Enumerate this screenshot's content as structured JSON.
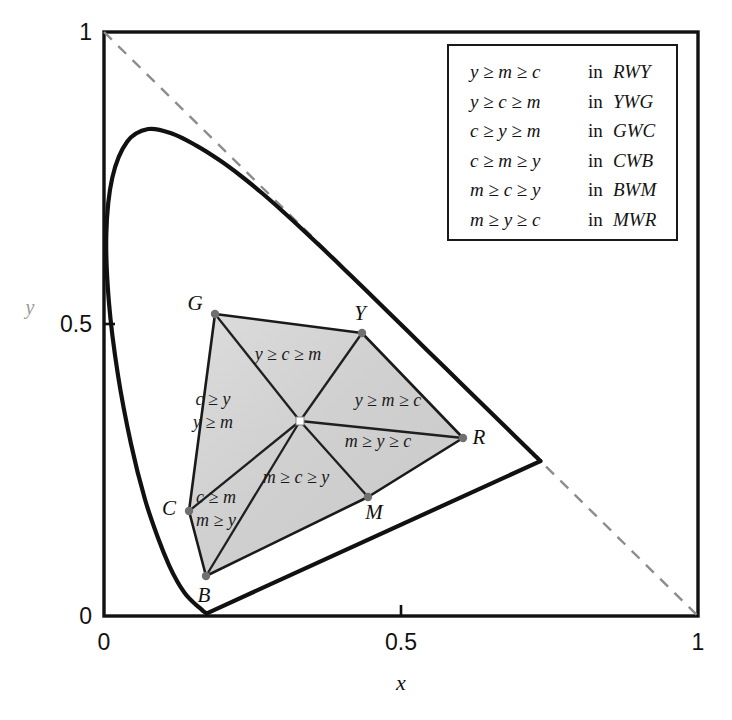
{
  "chart_data": {
    "type": "scatter",
    "title": "",
    "xlabel": "x",
    "ylabel": "y",
    "xlim": [
      0,
      1
    ],
    "ylim": [
      0,
      1
    ],
    "grid": false,
    "legend_position": "top-right",
    "xticks": [
      "0",
      "0.5",
      "1"
    ],
    "xtick_values": [
      0,
      0.5,
      1
    ],
    "yticks": [
      "0",
      "0.5",
      "1"
    ],
    "ytick_values": [
      0,
      0.5,
      1
    ],
    "annotations": [
      "CIE xy chromaticity diagram with spectral locus, purple line and RGB gamut hexagon"
    ],
    "series": [
      {
        "name": "spectral locus",
        "style": "solid-thick",
        "points": [
          [
            0.1741,
            0.005
          ],
          [
            0.174,
            0.005
          ],
          [
            0.1738,
            0.0049
          ],
          [
            0.1736,
            0.0049
          ],
          [
            0.1733,
            0.0048
          ],
          [
            0.173,
            0.0048
          ],
          [
            0.1726,
            0.0048
          ],
          [
            0.1721,
            0.0048
          ],
          [
            0.1714,
            0.0051
          ],
          [
            0.1703,
            0.0058
          ],
          [
            0.1689,
            0.0069
          ],
          [
            0.1669,
            0.0086
          ],
          [
            0.1644,
            0.0109
          ],
          [
            0.1611,
            0.0138
          ],
          [
            0.1566,
            0.0177
          ],
          [
            0.151,
            0.0227
          ],
          [
            0.144,
            0.0297
          ],
          [
            0.1355,
            0.0399
          ],
          [
            0.1241,
            0.0578
          ],
          [
            0.1096,
            0.0868
          ],
          [
            0.0913,
            0.1327
          ],
          [
            0.0687,
            0.2007
          ],
          [
            0.0454,
            0.295
          ],
          [
            0.0235,
            0.4127
          ],
          [
            0.0082,
            0.5384
          ],
          [
            0.0039,
            0.6548
          ],
          [
            0.0139,
            0.7502
          ],
          [
            0.0389,
            0.812
          ],
          [
            0.0743,
            0.8338
          ],
          [
            0.1142,
            0.8262
          ],
          [
            0.1547,
            0.8059
          ],
          [
            0.1929,
            0.7816
          ],
          [
            0.2296,
            0.7543
          ],
          [
            0.2658,
            0.7243
          ],
          [
            0.3016,
            0.6923
          ],
          [
            0.3373,
            0.6589
          ],
          [
            0.3731,
            0.6245
          ],
          [
            0.4087,
            0.5896
          ],
          [
            0.4441,
            0.5547
          ],
          [
            0.4788,
            0.5202
          ],
          [
            0.5125,
            0.4866
          ],
          [
            0.5448,
            0.4544
          ],
          [
            0.5752,
            0.4242
          ],
          [
            0.6029,
            0.3965
          ],
          [
            0.627,
            0.3725
          ],
          [
            0.6482,
            0.3514
          ],
          [
            0.6658,
            0.334
          ],
          [
            0.6801,
            0.3197
          ],
          [
            0.6915,
            0.3083
          ],
          [
            0.7006,
            0.2993
          ],
          [
            0.7079,
            0.292
          ],
          [
            0.714,
            0.2859
          ],
          [
            0.719,
            0.2809
          ],
          [
            0.723,
            0.277
          ],
          [
            0.726,
            0.274
          ],
          [
            0.7283,
            0.2717
          ],
          [
            0.73,
            0.27
          ],
          [
            0.7311,
            0.2689
          ],
          [
            0.732,
            0.268
          ],
          [
            0.7327,
            0.2673
          ],
          [
            0.7334,
            0.2666
          ],
          [
            0.734,
            0.266
          ],
          [
            0.7344,
            0.2656
          ],
          [
            0.7346,
            0.2654
          ],
          [
            0.7347,
            0.2653
          ]
        ]
      },
      {
        "name": "purple line",
        "style": "solid-thick",
        "points": [
          [
            0.7347,
            0.2653
          ],
          [
            0.1741,
            0.005
          ]
        ]
      },
      {
        "name": "x+y=1 reference line",
        "style": "dashed",
        "points": [
          [
            0.0,
            1.0
          ],
          [
            1.0,
            0.0
          ]
        ]
      }
    ],
    "gamut": {
      "name": "RGB hue hexagon",
      "fill_color": "#d2d2d2",
      "white_point": {
        "label": "W",
        "x": 0.33,
        "y": 0.3333,
        "px": [
          300,
          421
        ]
      },
      "vertices": [
        {
          "label": "G",
          "x": 0.18,
          "y": 0.5033,
          "px": [
            215,
            314
          ]
        },
        {
          "label": "Y",
          "x": 0.4347,
          "y": 0.4708,
          "px": [
            362,
            333
          ]
        },
        {
          "label": "R",
          "x": 0.6049,
          "y": 0.3013,
          "px": [
            463,
            438
          ]
        },
        {
          "label": "M",
          "x": 0.4448,
          "y": 0.2004,
          "px": [
            368,
            497
          ]
        },
        {
          "label": "B",
          "x": 0.1717,
          "y": 0.0681,
          "px": [
            206,
            576
          ]
        },
        {
          "label": "C",
          "x": 0.1431,
          "y": 0.1798,
          "px": [
            189,
            511
          ]
        }
      ],
      "sectors": [
        {
          "triangle": "RWY",
          "label": "y ≥ m ≥ c",
          "px": [
            388,
            406
          ]
        },
        {
          "triangle": "YWG",
          "label": "y ≥ c ≥ m",
          "px": [
            288,
            360
          ]
        },
        {
          "triangle": "GWC",
          "label_line1": "c ≥ y",
          "label_line2": "y ≥ m",
          "px": [
            213,
            405
          ]
        },
        {
          "triangle": "CWB",
          "label_line1": "c ≥ m",
          "label_line2": "m ≥ y",
          "px": [
            216,
            503
          ]
        },
        {
          "triangle": "BWM",
          "label": "m ≥ c ≥ y",
          "px": [
            296,
            483
          ]
        },
        {
          "triangle": "MWR",
          "label": "m ≥ y ≥ c",
          "px": [
            378,
            447
          ]
        }
      ]
    }
  },
  "axes": {
    "x_label": "x",
    "y_label": "y",
    "x_ticks": [
      {
        "value": "0",
        "pos": 0.0
      },
      {
        "value": "0.5",
        "pos": 0.5
      },
      {
        "value": "1",
        "pos": 1.0
      }
    ],
    "y_ticks": [
      {
        "value": "0",
        "pos": 0.0
      },
      {
        "value": "0.5",
        "pos": 0.5
      },
      {
        "value": "1",
        "pos": 1.0
      }
    ]
  },
  "legend": {
    "rows": [
      {
        "expr": "y ≥ m ≥ c",
        "in": "in",
        "tri": "RWY"
      },
      {
        "expr": "y ≥ c ≥ m",
        "in": "in",
        "tri": "YWG"
      },
      {
        "expr": "c ≥ y ≥ m",
        "in": "in",
        "tri": "GWC"
      },
      {
        "expr": "c ≥ m ≥ y",
        "in": "in",
        "tri": "CWB"
      },
      {
        "expr": "m ≥ c ≥ y",
        "in": "in",
        "tri": "BWM"
      },
      {
        "expr": "m ≥ y ≥ c",
        "in": "in",
        "tri": "MWR"
      }
    ]
  },
  "colors": {
    "line": "#111111",
    "dashed": "#8c8c8c",
    "gamut_fill": "#d2d2d2",
    "gamut_fill_light": "#e2e2e2",
    "frame": "#111111",
    "vertex_dot": "#707070",
    "background": "#ffffff"
  }
}
